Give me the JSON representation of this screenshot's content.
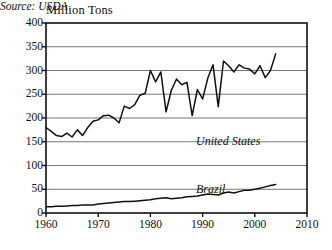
{
  "chart_data": {
    "type": "line",
    "title": "",
    "ylabel": "Million Tons",
    "xlabel": "",
    "ylim": [
      0,
      400
    ],
    "xlim": [
      1960,
      2010
    ],
    "yticks": [
      0,
      50,
      100,
      150,
      200,
      250,
      300,
      350,
      400
    ],
    "xticks": [
      1960,
      1970,
      1980,
      1990,
      2000,
      2010
    ],
    "grid": "horizontal",
    "legend_position": "inline-annotation",
    "annotations": [
      "United States",
      "Brazil",
      "Source: USDA"
    ],
    "source": "Source: USDA",
    "line_color": "#111111",
    "grid_color": "#777777",
    "axis_color": "#111111",
    "background": "#ffffff",
    "x": [
      1960,
      1961,
      1962,
      1963,
      1964,
      1965,
      1966,
      1967,
      1968,
      1969,
      1970,
      1971,
      1972,
      1973,
      1974,
      1975,
      1976,
      1977,
      1978,
      1979,
      1980,
      1981,
      1982,
      1983,
      1984,
      1985,
      1986,
      1987,
      1988,
      1989,
      1990,
      1991,
      1992,
      1993,
      1994,
      1995,
      1996,
      1997,
      1998,
      1999,
      2000,
      2001,
      2002,
      2003,
      2004
    ],
    "series": [
      {
        "name": "United States",
        "values": [
          180,
          172,
          163,
          161,
          168,
          160,
          175,
          163,
          180,
          193,
          196,
          205,
          206,
          200,
          190,
          225,
          220,
          228,
          248,
          252,
          300,
          276,
          297,
          213,
          258,
          282,
          270,
          275,
          205,
          260,
          240,
          284,
          312,
          224,
          320,
          310,
          297,
          312,
          305,
          303,
          293,
          310,
          285,
          300,
          335
        ]
      },
      {
        "name": "Brazil",
        "values": [
          13,
          13,
          14,
          14,
          15,
          16,
          16,
          17,
          17,
          17,
          19,
          20,
          21,
          22,
          23,
          24,
          24,
          25,
          26,
          27,
          28,
          30,
          31,
          32,
          30,
          31,
          32,
          34,
          35,
          36,
          38,
          40,
          39,
          38,
          42,
          44,
          42,
          45,
          48,
          48,
          50,
          52,
          55,
          58,
          60
        ]
      }
    ]
  },
  "axes": {
    "y_label_text": "Million Tons",
    "y_tick_labels": [
      "400",
      "350",
      "300",
      "250",
      "200",
      "150",
      "100",
      "50",
      "0"
    ],
    "x_tick_labels": [
      "1960",
      "1970",
      "1980",
      "1990",
      "2000",
      "2010"
    ]
  },
  "labels": {
    "united_states": "United States",
    "brazil": "Brazil",
    "source": "Source: USDA"
  }
}
